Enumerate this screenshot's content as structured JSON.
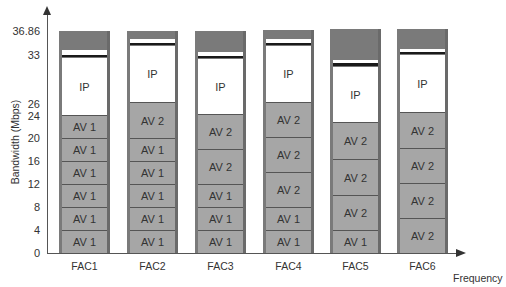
{
  "chart_data": {
    "type": "bar",
    "stacked": true,
    "title": "",
    "xlabel": "Frequency",
    "ylabel": "Bandwidth (Mbps)",
    "ylim": [
      0,
      36.86
    ],
    "y_ticks": [
      "0",
      "4",
      "8",
      "12",
      "16",
      "20",
      "24",
      "26",
      "33",
      "36.86"
    ],
    "categories": [
      "FAC1",
      "FAC2",
      "FAC3",
      "FAC4",
      "FAC5",
      "FAC6"
    ],
    "segment_types": {
      "AV 1": "Audio/Video class 1 (4 Mbps each)",
      "AV 2": "Audio/Video class 2 (~6 Mbps each)",
      "IP": "IP traffic (remaining capacity)",
      "overhead": "Reserved/overhead band up to 36.86"
    },
    "stacks": [
      {
        "category": "FAC1",
        "segments": [
          "AV 1",
          "AV 1",
          "AV 1",
          "AV 1",
          "AV 1",
          "AV 1",
          "IP"
        ],
        "av_top": 24,
        "ip_top": 33
      },
      {
        "category": "FAC2",
        "segments": [
          "AV 1",
          "AV 1",
          "AV 1",
          "AV 1",
          "AV 1",
          "AV 2",
          "IP"
        ],
        "av_top": 26,
        "ip_top": 34.5
      },
      {
        "category": "FAC3",
        "segments": [
          "AV 1",
          "AV 1",
          "AV 1",
          "AV 2",
          "AV 2",
          "IP"
        ],
        "av_top": 24,
        "ip_top": 33
      },
      {
        "category": "FAC4",
        "segments": [
          "AV 1",
          "AV 1",
          "AV 2",
          "AV 2",
          "AV 2",
          "IP"
        ],
        "av_top": 26,
        "ip_top": 34.5
      },
      {
        "category": "FAC5",
        "segments": [
          "AV 1",
          "AV 2",
          "AV 2",
          "AV 2",
          "IP"
        ],
        "av_top": 22.5,
        "ip_top": 31.5
      },
      {
        "category": "FAC6",
        "segments": [
          "AV 2",
          "AV 2",
          "AV 2",
          "AV 2",
          "IP"
        ],
        "av_top": 24.5,
        "ip_top": 33.5
      }
    ],
    "colors": {
      "av": "#a6a6a6",
      "ip": "#ffffff",
      "overhead": "#7a7a7a",
      "divider": "#1a1a1a"
    }
  },
  "axis": {
    "y_label": "Bandwidth (Mbps)",
    "x_label": "Frequency",
    "y_ticks": [
      {
        "label": "36.86",
        "y": 31
      },
      {
        "label": "33",
        "y": 55
      },
      {
        "label": "26",
        "y": 104
      },
      {
        "label": "24",
        "y": 116
      },
      {
        "label": "20",
        "y": 138
      },
      {
        "label": "16",
        "y": 161
      },
      {
        "label": "12",
        "y": 184
      },
      {
        "label": "8",
        "y": 207
      },
      {
        "label": "4",
        "y": 230
      },
      {
        "label": "0",
        "y": 253
      }
    ]
  },
  "columns": [
    {
      "label": "FAC1",
      "x": 59,
      "segments": [
        {
          "t": "top",
          "y0": 31,
          "y1": 50,
          "text": ""
        },
        {
          "t": "strip",
          "y0": 50,
          "y1": 55,
          "text": ""
        },
        {
          "t": "line",
          "y0": 55,
          "y1": 57,
          "text": ""
        },
        {
          "t": "ip",
          "y0": 57,
          "y1": 115,
          "text": "IP"
        },
        {
          "t": "av",
          "y0": 115,
          "y1": 138,
          "text": "AV 1"
        },
        {
          "t": "av",
          "y0": 138,
          "y1": 161,
          "text": "AV 1"
        },
        {
          "t": "av",
          "y0": 161,
          "y1": 184,
          "text": "AV 1"
        },
        {
          "t": "av",
          "y0": 184,
          "y1": 207,
          "text": "AV 1"
        },
        {
          "t": "av",
          "y0": 207,
          "y1": 230,
          "text": "AV 1"
        },
        {
          "t": "av",
          "y0": 230,
          "y1": 253,
          "text": "AV 1"
        }
      ]
    },
    {
      "label": "FAC2",
      "x": 127,
      "segments": [
        {
          "t": "top",
          "y0": 31,
          "y1": 39,
          "text": ""
        },
        {
          "t": "strip",
          "y0": 39,
          "y1": 43,
          "text": ""
        },
        {
          "t": "line",
          "y0": 43,
          "y1": 45,
          "text": ""
        },
        {
          "t": "ip",
          "y0": 45,
          "y1": 102,
          "text": "IP"
        },
        {
          "t": "av",
          "y0": 102,
          "y1": 138,
          "text": "AV 2"
        },
        {
          "t": "av",
          "y0": 138,
          "y1": 161,
          "text": "AV 1"
        },
        {
          "t": "av",
          "y0": 161,
          "y1": 184,
          "text": "AV 1"
        },
        {
          "t": "av",
          "y0": 184,
          "y1": 207,
          "text": "AV 1"
        },
        {
          "t": "av",
          "y0": 207,
          "y1": 230,
          "text": "AV 1"
        },
        {
          "t": "av",
          "y0": 230,
          "y1": 253,
          "text": "AV 1"
        }
      ]
    },
    {
      "label": "FAC3",
      "x": 195,
      "segments": [
        {
          "t": "top",
          "y0": 31,
          "y1": 52,
          "text": ""
        },
        {
          "t": "strip",
          "y0": 52,
          "y1": 56,
          "text": ""
        },
        {
          "t": "line",
          "y0": 56,
          "y1": 58,
          "text": ""
        },
        {
          "t": "ip",
          "y0": 58,
          "y1": 114,
          "text": "IP"
        },
        {
          "t": "av",
          "y0": 114,
          "y1": 149,
          "text": "AV 2"
        },
        {
          "t": "av",
          "y0": 149,
          "y1": 184,
          "text": "AV 2"
        },
        {
          "t": "av",
          "y0": 184,
          "y1": 207,
          "text": "AV 1"
        },
        {
          "t": "av",
          "y0": 207,
          "y1": 230,
          "text": "AV 1"
        },
        {
          "t": "av",
          "y0": 230,
          "y1": 253,
          "text": "AV 1"
        }
      ]
    },
    {
      "label": "FAC4",
      "x": 263,
      "segments": [
        {
          "t": "top",
          "y0": 30,
          "y1": 39,
          "text": ""
        },
        {
          "t": "strip",
          "y0": 39,
          "y1": 43,
          "text": ""
        },
        {
          "t": "line",
          "y0": 43,
          "y1": 45,
          "text": ""
        },
        {
          "t": "ip",
          "y0": 45,
          "y1": 102,
          "text": "IP"
        },
        {
          "t": "av",
          "y0": 102,
          "y1": 137,
          "text": "AV 2"
        },
        {
          "t": "av",
          "y0": 137,
          "y1": 172,
          "text": "AV 2"
        },
        {
          "t": "av",
          "y0": 172,
          "y1": 207,
          "text": "AV 2"
        },
        {
          "t": "av",
          "y0": 207,
          "y1": 230,
          "text": "AV 1"
        },
        {
          "t": "av",
          "y0": 230,
          "y1": 253,
          "text": "AV 1"
        }
      ]
    },
    {
      "label": "FAC5",
      "x": 330,
      "segments": [
        {
          "t": "top",
          "y0": 29,
          "y1": 60,
          "text": ""
        },
        {
          "t": "strip",
          "y0": 60,
          "y1": 63,
          "text": ""
        },
        {
          "t": "line",
          "y0": 63,
          "y1": 66,
          "text": ""
        },
        {
          "t": "ip",
          "y0": 66,
          "y1": 122,
          "text": "IP"
        },
        {
          "t": "av",
          "y0": 122,
          "y1": 159,
          "text": "AV 2"
        },
        {
          "t": "av",
          "y0": 159,
          "y1": 195,
          "text": "AV 2"
        },
        {
          "t": "av",
          "y0": 195,
          "y1": 230,
          "text": "AV 2"
        },
        {
          "t": "av",
          "y0": 230,
          "y1": 253,
          "text": "AV 1"
        }
      ]
    },
    {
      "label": "FAC6",
      "x": 397,
      "segments": [
        {
          "t": "top",
          "y0": 29,
          "y1": 49,
          "text": ""
        },
        {
          "t": "strip",
          "y0": 49,
          "y1": 52,
          "text": ""
        },
        {
          "t": "line",
          "y0": 52,
          "y1": 54,
          "text": ""
        },
        {
          "t": "ip",
          "y0": 54,
          "y1": 112,
          "text": "IP"
        },
        {
          "t": "av",
          "y0": 112,
          "y1": 148,
          "text": "AV 2"
        },
        {
          "t": "av",
          "y0": 148,
          "y1": 183,
          "text": "AV 2"
        },
        {
          "t": "av",
          "y0": 183,
          "y1": 218,
          "text": "AV 2"
        },
        {
          "t": "av",
          "y0": 218,
          "y1": 253,
          "text": "AV 2"
        }
      ]
    }
  ]
}
